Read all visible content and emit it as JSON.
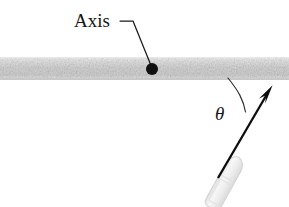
{
  "figure": {
    "kind": "physics-diagram",
    "title_text": "",
    "background_color": "#ffffff",
    "width": 289,
    "height": 207,
    "labels": {
      "axis": "Axis",
      "angle": "θ"
    },
    "elements": {
      "rod": {
        "name": "horizontal rod",
        "fill_color": "#d8d8d8",
        "edge_color": "#c2c2c2",
        "x": 0,
        "y": 57,
        "width": 289,
        "height": 23
      },
      "pivot_dot": {
        "name": "axis pivot point",
        "color": "#101010",
        "cx": 152,
        "cy": 69,
        "r": 6
      },
      "leader_line": {
        "name": "axis leader line",
        "color": "#1a1a1a",
        "points": "120,21 133,21 152,68"
      },
      "angle_arc": {
        "name": "angle arc theta",
        "color": "#2b2b2b",
        "path": "M 228 78 C 238 92 243 100 245 112"
      },
      "velocity_arrow": {
        "name": "bullet velocity arrow",
        "color": "#0d0d0d",
        "tail_x": 218,
        "tail_y": 178,
        "tip_x": 272,
        "tip_y": 86
      },
      "bullet": {
        "name": "bullet projectile",
        "fill_color": "#efefef",
        "edge_color": "#d2d2d2",
        "cx": 224,
        "cy": 184,
        "rotation_deg": 29
      }
    }
  }
}
